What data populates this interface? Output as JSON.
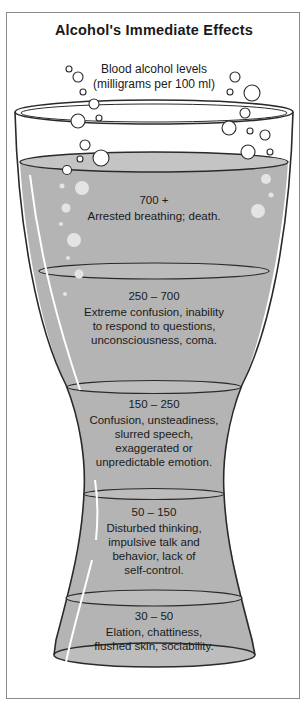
{
  "title": "Alcohol's Immediate Effects",
  "subtitle": {
    "line1": "Blood alcohol levels",
    "line2": "(milligrams per 100 ml)"
  },
  "colors": {
    "liquid": "#b4b4b4",
    "outline": "#2a2a2a",
    "frame": "#8a8a8a",
    "bubble_fill": "#e4e4e4"
  },
  "bands": [
    {
      "range": "700 +",
      "effects": [
        "Arrested breathing; death."
      ]
    },
    {
      "range": "250 – 700",
      "effects": [
        "Extreme confusion, inability",
        "to respond to questions,",
        "unconsciousness, coma."
      ]
    },
    {
      "range": "150 – 250",
      "effects": [
        "Confusion, unsteadiness,",
        "slurred speech,",
        "exaggerated or",
        "unpredictable emotion."
      ]
    },
    {
      "range": "50 – 150",
      "effects": [
        "Disturbed thinking,",
        "impulsive talk and",
        "behavior, lack of",
        "self-control."
      ]
    },
    {
      "range": "30 – 50",
      "effects": [
        "Elation, chattiness,",
        "flushed skin, sociability."
      ]
    }
  ]
}
